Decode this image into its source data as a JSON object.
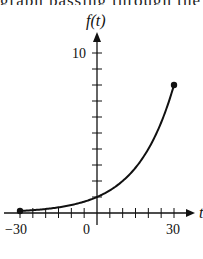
{
  "header_fragment": "graph passing through the origin",
  "chart_data": {
    "type": "line",
    "title": "",
    "xlabel": "t",
    "ylabel": "f(t)",
    "xlim": [
      -30,
      30
    ],
    "ylim": [
      0,
      10
    ],
    "x_tick_labels": [
      "-30",
      "0",
      "30"
    ],
    "x_tick_step": 5,
    "y_tick_labels": [
      "10"
    ],
    "y_tick_step": 1,
    "grid": false,
    "legend": null,
    "series": [
      {
        "name": "f(t)",
        "function": "exponential",
        "x": [
          -30,
          -20,
          -10,
          0,
          10,
          20,
          30
        ],
        "values": [
          0.125,
          0.25,
          0.5,
          1,
          2,
          4,
          8
        ],
        "endpoints": [
          [
            -30,
            0.125
          ],
          [
            30,
            8
          ]
        ]
      }
    ]
  },
  "labels": {
    "y_axis": "f(t)",
    "x_axis": "t",
    "y_ten": "10",
    "x_neg30": "−30",
    "x_zero": "0",
    "x_30": "30"
  }
}
